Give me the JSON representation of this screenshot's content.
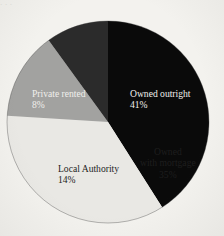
{
  "figure": {
    "background_color": "#f3f2ee",
    "header_fragment": "· · ·"
  },
  "chart_data": {
    "type": "pie",
    "title": "",
    "xlabel": "",
    "ylabel": "",
    "legend_position": "none",
    "grid": false,
    "start_angle_deg": 0,
    "direction": "clockwise",
    "center": {
      "x": 108,
      "y": 122
    },
    "radius": 101,
    "categories": [
      "Owned outright",
      "Owned with mortgage",
      "Local Authority",
      "Private rented"
    ],
    "values": [
      41,
      35,
      14,
      8
    ],
    "value_unit": "%",
    "slices": [
      {
        "label": "Owned outright",
        "value": 41,
        "value_text": "41%",
        "color": "#0a0a0a",
        "text_color": "#f0efec",
        "start_deg": 0,
        "end_deg": 147.6
      },
      {
        "label": "Owned with mortgage",
        "value": 35,
        "value_text": "35%",
        "color": "#e9e8e4",
        "text_color": "#1e1e1e",
        "start_deg": 147.6,
        "end_deg": 273.6
      },
      {
        "label": "Local Authority",
        "value": 14,
        "value_text": "14%",
        "color": "#a2a2a0",
        "text_color": "#1e1e1e",
        "start_deg": 273.6,
        "end_deg": 324.0
      },
      {
        "label": "Private rented",
        "value": 8,
        "value_text": "8%",
        "color": "#2b2b2b",
        "text_color": "#f0efec",
        "start_deg": 324.0,
        "end_deg": 360.0
      }
    ]
  },
  "labels": {
    "owned_outright": {
      "name": "Owned outright",
      "value": "41%"
    },
    "owned_with_mortgage": {
      "name_line1": "Owned",
      "name_line2": "with mortgage",
      "value": "35%"
    },
    "local_authority": {
      "name": "Local Authority",
      "value": "14%"
    },
    "private_rented": {
      "name": "Private rented",
      "value": "8%"
    }
  }
}
